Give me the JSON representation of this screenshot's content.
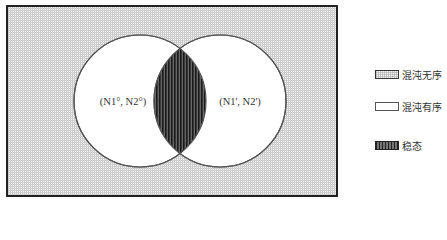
{
  "diagram": {
    "type": "venn",
    "left_circle": {
      "label": "(N1°, N2°)"
    },
    "right_circle": {
      "label": "(N1', N2')"
    },
    "background_region": "chaotic-disorder",
    "intersection_region": "steady-state"
  },
  "legend": {
    "items": [
      {
        "label": "混沌无序",
        "swatch": "dotted-grid"
      },
      {
        "label": "混沌有序",
        "swatch": "white"
      },
      {
        "label": "稳态",
        "swatch": "vertical-stripes"
      }
    ]
  },
  "colors": {
    "border": "#222222",
    "grid": "#b4b4b4",
    "circle_fill": "#ffffff",
    "stripe_dark": "#222222"
  }
}
